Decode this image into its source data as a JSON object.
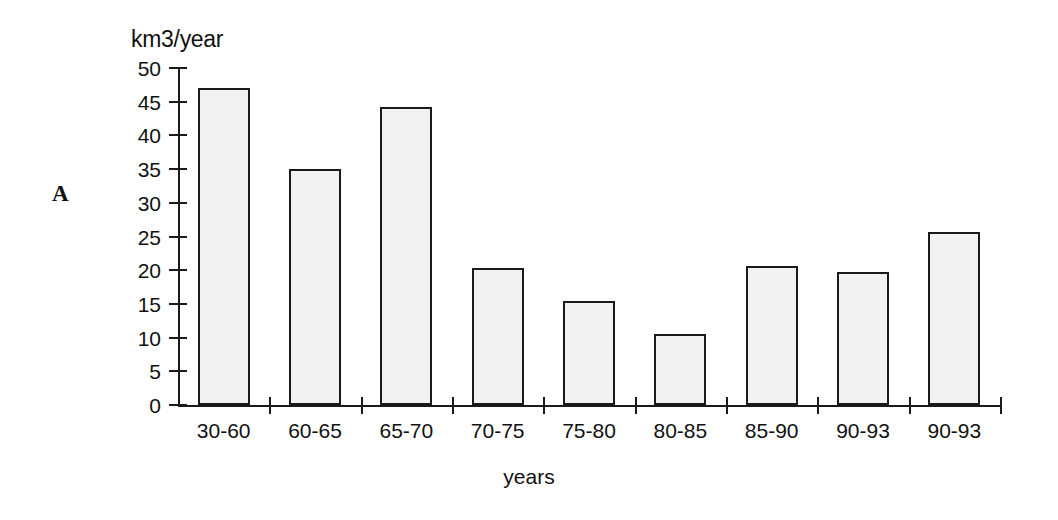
{
  "panel": {
    "label": "A"
  },
  "axes": {
    "y_title": "km3/year",
    "x_title": "years",
    "y_ticks": [
      "0",
      "5",
      "10",
      "15",
      "20",
      "25",
      "30",
      "35",
      "40",
      "45",
      "50"
    ]
  },
  "colors": {
    "ink": "#1a1a1a",
    "bar_fill": "#f2f2f2",
    "bar_stroke": "#1a1a1a",
    "background": "#ffffff"
  },
  "chart_data": {
    "type": "bar",
    "title": "",
    "xlabel": "years",
    "ylabel": "km3/year",
    "ylim": [
      0,
      50
    ],
    "ytick_step": 5,
    "grid": false,
    "legend": false,
    "categories": [
      "30-60",
      "60-65",
      "65-70",
      "70-75",
      "75-80",
      "80-85",
      "85-90",
      "90-93",
      "90-93"
    ],
    "values": [
      47.0,
      35.0,
      44.2,
      20.3,
      15.5,
      10.5,
      20.6,
      19.7,
      25.7
    ]
  }
}
